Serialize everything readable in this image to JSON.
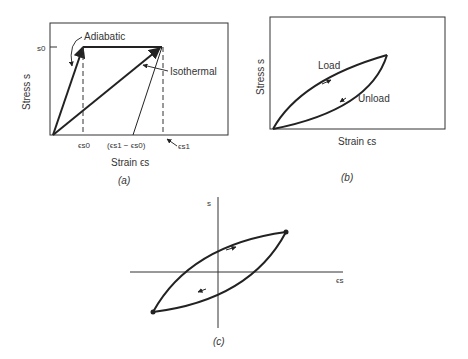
{
  "figure": {
    "panels": [
      {
        "id": "a",
        "caption": "(a)",
        "xlabel": "Strain ϵs",
        "ylabel": "Stress s",
        "y_tick": "s0",
        "x_ticks": [
          "ϵs0",
          "(ϵs1 − ϵs0)",
          "ϵs1"
        ],
        "annotations": [
          "Adiabatic",
          "Isothermal"
        ]
      },
      {
        "id": "b",
        "caption": "(b)",
        "xlabel": "Strain ϵs",
        "ylabel": "Stress s",
        "annotations": [
          "Load",
          "Unload"
        ]
      },
      {
        "id": "c",
        "caption": "(c)",
        "xlabel": "ϵs",
        "ylabel": "s"
      }
    ]
  }
}
